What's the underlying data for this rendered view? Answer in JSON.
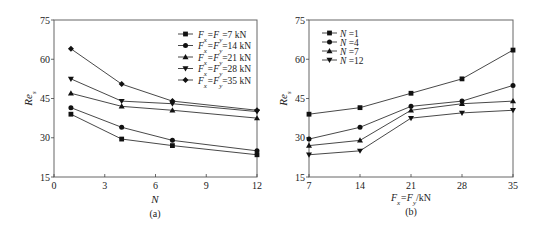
{
  "chart_data": [
    {
      "type": "line",
      "panel": "(a)",
      "title": "",
      "xlabel": "N",
      "ylabel": "Re_s",
      "xlim": [
        0,
        12
      ],
      "ylim": [
        15,
        75
      ],
      "xticks": [
        "0",
        "3",
        "6",
        "9",
        "12"
      ],
      "yticks": [
        "15",
        "30",
        "45",
        "60",
        "75"
      ],
      "grid": false,
      "legend_position": "upper right",
      "x": [
        1,
        4,
        7,
        12
      ],
      "series": [
        {
          "name": "Fx=Fy=7 kN",
          "marker": "square",
          "values": [
            39,
            29.5,
            27,
            23.5
          ]
        },
        {
          "name": "Fx=Fy=14 kN",
          "marker": "circle",
          "values": [
            41.5,
            34,
            29,
            25
          ]
        },
        {
          "name": "Fx=Fy=21 kN",
          "marker": "triangle-up",
          "values": [
            47,
            42,
            40.5,
            37.5
          ]
        },
        {
          "name": "Fx=Fy=28 kN",
          "marker": "triangle-down",
          "values": [
            52.5,
            44,
            43,
            40
          ]
        },
        {
          "name": "Fx=Fy=35 kN",
          "marker": "diamond",
          "values": [
            64,
            50.5,
            44,
            40.5
          ]
        }
      ]
    },
    {
      "type": "line",
      "panel": "(b)",
      "title": "",
      "xlabel": "Fx=Fy/kN",
      "ylabel": "Re_s",
      "xlim": [
        7,
        35
      ],
      "ylim": [
        15,
        75
      ],
      "xticks": [
        "7",
        "14",
        "21",
        "28",
        "35"
      ],
      "yticks": [
        "15",
        "30",
        "45",
        "60",
        "75"
      ],
      "grid": false,
      "legend_position": "upper left",
      "x": [
        7,
        14,
        21,
        28,
        35
      ],
      "series": [
        {
          "name": "N=1",
          "marker": "square",
          "values": [
            39,
            41.5,
            47,
            52.5,
            63.5
          ]
        },
        {
          "name": "N=4",
          "marker": "circle",
          "values": [
            29.5,
            34,
            42,
            44,
            50
          ]
        },
        {
          "name": "N=7",
          "marker": "triangle-up",
          "values": [
            27,
            29,
            40.5,
            43,
            44
          ]
        },
        {
          "name": "N=12",
          "marker": "triangle-down",
          "values": [
            23.5,
            25,
            37.5,
            39.5,
            40.5
          ]
        }
      ]
    }
  ],
  "panels": {
    "a": {
      "caption": "(a)",
      "xlabel": "N",
      "ylabel_main": "Re",
      "ylabel_sub": "s",
      "legend": [
        {
          "pre": "F",
          "s1": "x",
          "mid": "=F",
          "s2": "y",
          "post": "=7 kN"
        },
        {
          "pre": "F",
          "s1": "x",
          "mid": "=F",
          "s2": "y",
          "post": "=14 kN"
        },
        {
          "pre": "F",
          "s1": "x",
          "mid": "=F",
          "s2": "y",
          "post": "=21 kN"
        },
        {
          "pre": "F",
          "s1": "x",
          "mid": "=F",
          "s2": "y",
          "post": "=28 kN"
        },
        {
          "pre": "F",
          "s1": "x",
          "mid": "=F",
          "s2": "y",
          "post": "=35 kN"
        }
      ]
    },
    "b": {
      "caption": "(b)",
      "xlabel_pre": "F",
      "xlabel_s1": "x",
      "xlabel_mid": "=F",
      "xlabel_s2": "y",
      "xlabel_post": "/kN",
      "ylabel_main": "Re",
      "ylabel_sub": "s",
      "legend": [
        "N =1",
        "N =4",
        "N =7",
        "N =12"
      ]
    }
  }
}
